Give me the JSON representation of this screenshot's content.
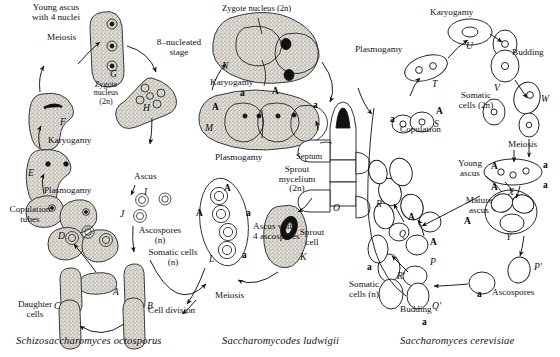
{
  "figure": {
    "type": "biological-life-cycle-diagram",
    "panels": 3
  },
  "panels": [
    {
      "id": "panel-left",
      "species": "Schizosaccharomyces octosporus",
      "labels": {
        "young_ascus": "Young ascus\nwith 4 nuclei",
        "meiosis": "Meiosis",
        "zygote_nucleus": "Zygote\nnucleus\n(2n)",
        "eight_nucleated": "8–nucleated\nstage",
        "karyogamy": "Karyogamy",
        "plasmogamy": "Plasmogamy",
        "copulation_tubes": "Copulation\ntubes",
        "ascus": "Ascus",
        "ascospores": "Ascospores\n(n)",
        "somatic_cells": "Somatic cells\n(n)",
        "daughter_cells": "Daughter\ncells",
        "cell_division": "Cell division"
      },
      "stages": [
        "A",
        "B",
        "C",
        "D",
        "E",
        "F",
        "G",
        "H",
        "I",
        "J"
      ]
    },
    {
      "id": "panel-middle",
      "species": "Saccharomycodes ludwigii",
      "labels": {
        "zygote_nucleus": "Zygote nucleus (2n)",
        "karyogamy": "Karyogamy",
        "plasmogamy": "Plasmogamy",
        "septum": "Septum",
        "sprout_mycelium": "Sprout\nmycelium\n(2n)",
        "sprout_cell": "Sprout\ncell",
        "ascus_with_4": "Ascus with\n4 ascospores",
        "meiosis": "Meiosis"
      },
      "stages": [
        "K",
        "L",
        "M",
        "N",
        "O"
      ],
      "mating_types": [
        "A",
        "a"
      ]
    },
    {
      "id": "panel-right",
      "species": "Saccharomyces cerevisiae",
      "labels": {
        "karyogamy": "Karyogamy",
        "plasmogamy": "Plasmogamy",
        "budding_top": "Budding",
        "somatic_cells_2n": "Somatic\ncells (2n)",
        "meiosis": "Meiosis",
        "copulation": "Copulation",
        "young_ascus": "Young\nascus",
        "mature_ascus": "Mature\nascus",
        "ascospores": "Ascospores",
        "somatic_cells_n": "Somatic\ncells (n)",
        "budding_bottom": "Budding"
      },
      "stages": [
        "P",
        "Q",
        "R",
        "S",
        "T",
        "U",
        "V",
        "W",
        "X",
        "Y",
        "P'",
        "Q'",
        "R'"
      ],
      "mating_types": [
        "A",
        "a"
      ]
    }
  ],
  "colors": {
    "ink": "#111111",
    "stipple": "#8c8c8c",
    "cell_fill": "#d8d5cf",
    "paper": "#ffffff"
  }
}
